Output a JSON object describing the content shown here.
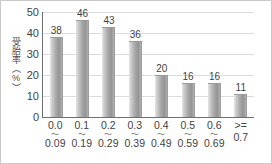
{
  "chart_data": {
    "type": "bar",
    "title": "",
    "xlabel": "",
    "ylabel": "受胎率（%）",
    "ylim": [
      0,
      50
    ],
    "ytick_labels": [
      "50",
      "40",
      "30",
      "20",
      "10",
      "0"
    ],
    "ytick_values": [
      50,
      40,
      30,
      20,
      10,
      0
    ],
    "grid": true,
    "legend": "none",
    "categories": [
      "0.0～0.09",
      "0.1～0.19",
      "0.2～0.29",
      "0.3～0.39",
      "0.4～0.49",
      "0.5～0.59",
      "0.6～0.69",
      ">= 0.7"
    ],
    "category_parts": [
      {
        "lower": "0.0",
        "separator": "～",
        "upper": "0.09"
      },
      {
        "lower": "0.1",
        "separator": "～",
        "upper": "0.19"
      },
      {
        "lower": "0.2",
        "separator": "～",
        "upper": "0.29"
      },
      {
        "lower": "0.3",
        "separator": "～",
        "upper": "0.39"
      },
      {
        "lower": "0.4",
        "separator": "～",
        "upper": "0.49"
      },
      {
        "lower": "0.5",
        "separator": "～",
        "upper": "0.59"
      },
      {
        "lower": "0.6",
        "separator": "～",
        "upper": "0.69"
      },
      {
        "lower": ">=",
        "separator": "",
        "upper": "0.7"
      }
    ],
    "values": [
      38,
      46,
      43,
      36,
      20,
      16,
      16,
      11
    ],
    "value_labels": [
      "38",
      "46",
      "43",
      "36",
      "20",
      "16",
      "16",
      "11"
    ],
    "colors": {
      "bar_light": "#e6e6e6",
      "bar_mid": "#a8a8a8",
      "bar_dark": "#8e8e8e",
      "axis": "#6f6f6f",
      "grid": "#dcdcdc",
      "text": "#3f3f3f",
      "frame": "#c9c9c9",
      "background": "#ffffff"
    }
  }
}
